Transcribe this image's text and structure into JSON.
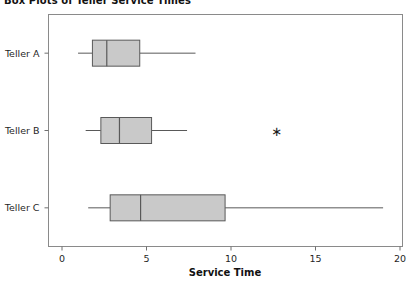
{
  "chart_data": {
    "type": "box",
    "title": "Box Plots of Teller Service Times",
    "orientation": "horizontal",
    "xlabel": "Service Time",
    "ylabel": "",
    "xlim": [
      0,
      20.6
    ],
    "xticks": [
      0,
      5,
      10,
      15,
      20
    ],
    "xticklabels": [
      "0",
      "5",
      "10",
      "15",
      "20"
    ],
    "categories": [
      "Teller A",
      "Teller B",
      "Teller C"
    ],
    "grid": false,
    "legend": false,
    "box_fill_color": "#c9c9c9",
    "box_edge_color": "#595959",
    "whisker_color": "#595959",
    "frame_color": "#8a8a8a",
    "outlier_marker": "asterisk",
    "boxes": [
      {
        "category": "Teller A",
        "whisker_low": 0.95,
        "q1": 1.8,
        "median": 2.65,
        "q3": 4.6,
        "whisker_high": 7.9,
        "outliers": []
      },
      {
        "category": "Teller B",
        "whisker_low": 1.4,
        "q1": 2.3,
        "median": 3.4,
        "q3": 5.3,
        "whisker_high": 7.4,
        "outliers": [
          12.7
        ]
      },
      {
        "category": "Teller C",
        "whisker_low": 1.55,
        "q1": 2.85,
        "median": 4.65,
        "q3": 9.65,
        "whisker_high": 19.0,
        "outliers": []
      }
    ]
  }
}
